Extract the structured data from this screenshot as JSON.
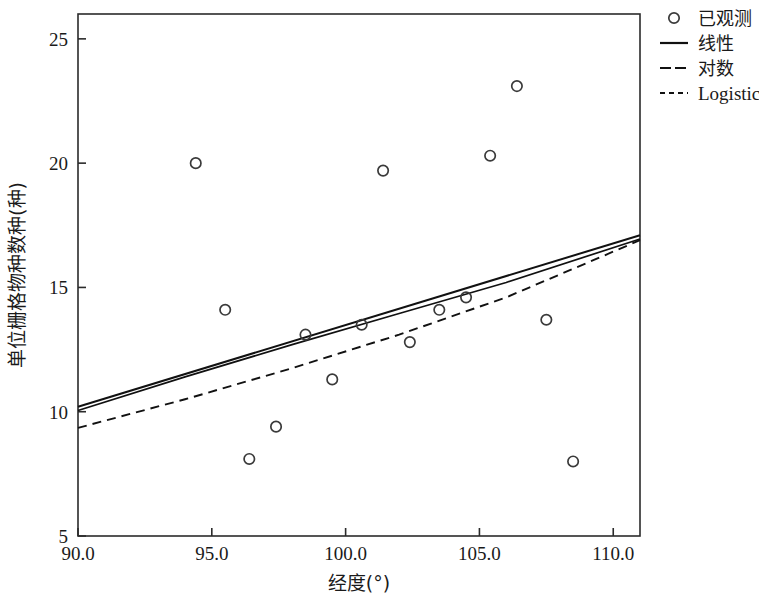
{
  "chart_data": {
    "type": "scatter",
    "title": "",
    "xlabel": "经度(°)",
    "ylabel": "单位栅格物种数种(种)",
    "xlim": [
      90.0,
      111.0
    ],
    "ylim": [
      5,
      26
    ],
    "grid": false,
    "xticks": [
      90.0,
      95.0,
      100.0,
      105.0,
      110.0
    ],
    "xtick_labels": [
      "90.0",
      "95.0",
      "100.0",
      "105.0",
      "110.0"
    ],
    "yticks": [
      5,
      10,
      15,
      20,
      25
    ],
    "ytick_labels": [
      "5",
      "10",
      "15",
      "20",
      "25"
    ],
    "legend_position": "top-right",
    "series": [
      {
        "name": "已观测",
        "type": "scatter",
        "marker": "open-circle",
        "color": "#3a3a3a",
        "points": [
          {
            "x": 94.4,
            "y": 20.0
          },
          {
            "x": 95.5,
            "y": 14.1
          },
          {
            "x": 96.4,
            "y": 8.1
          },
          {
            "x": 97.4,
            "y": 9.4
          },
          {
            "x": 98.5,
            "y": 13.1
          },
          {
            "x": 99.5,
            "y": 11.3
          },
          {
            "x": 100.6,
            "y": 13.5
          },
          {
            "x": 101.4,
            "y": 19.7
          },
          {
            "x": 102.4,
            "y": 12.8
          },
          {
            "x": 103.5,
            "y": 14.1
          },
          {
            "x": 104.5,
            "y": 14.6
          },
          {
            "x": 105.4,
            "y": 20.3
          },
          {
            "x": 106.4,
            "y": 23.1
          },
          {
            "x": 107.5,
            "y": 13.7
          },
          {
            "x": 108.5,
            "y": 8.0
          }
        ]
      },
      {
        "name": "线性",
        "type": "line",
        "style": "solid",
        "color": "#111111",
        "x": [
          90.0,
          111.0
        ],
        "values": [
          10.2,
          17.1
        ]
      },
      {
        "name": "对数",
        "type": "line",
        "style": "solid-thin",
        "color": "#111111",
        "x": [
          90.0,
          94.0,
          98.0,
          102.0,
          106.0,
          111.0
        ],
        "values": [
          10.05,
          11.4,
          12.7,
          13.95,
          15.2,
          16.95
        ]
      },
      {
        "name": "Logistic",
        "type": "line",
        "style": "dashed",
        "color": "#111111",
        "x": [
          90.0,
          94.0,
          98.0,
          102.0,
          106.0,
          111.0
        ],
        "values": [
          9.35,
          10.5,
          11.75,
          13.1,
          14.6,
          16.9
        ]
      }
    ]
  },
  "legend": {
    "entries": [
      {
        "label": "已观测",
        "marker": "open-circle"
      },
      {
        "label": "线性",
        "marker": "solid-line"
      },
      {
        "label": "对数",
        "marker": "dashed-line-long"
      },
      {
        "label": "Logistic",
        "marker": "dashed-line-short"
      }
    ]
  },
  "axes": {
    "x_title": "经度(°)",
    "y_title": "单位栅格物种数种(种)",
    "x_tick_labels": [
      "90.0",
      "95.0",
      "100.0",
      "105.0",
      "110.0"
    ],
    "y_tick_labels": [
      "5",
      "10",
      "15",
      "20",
      "25"
    ]
  }
}
